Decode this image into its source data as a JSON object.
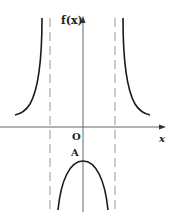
{
  "diagram": {
    "type": "function-graph",
    "y_axis_label": "f(x)",
    "x_axis_label": "x",
    "origin_label": "O",
    "point_label": "A",
    "colors": {
      "curve": "#1a1a1a",
      "axis": "#555555",
      "asymptote": "#aaaaaa"
    }
  }
}
